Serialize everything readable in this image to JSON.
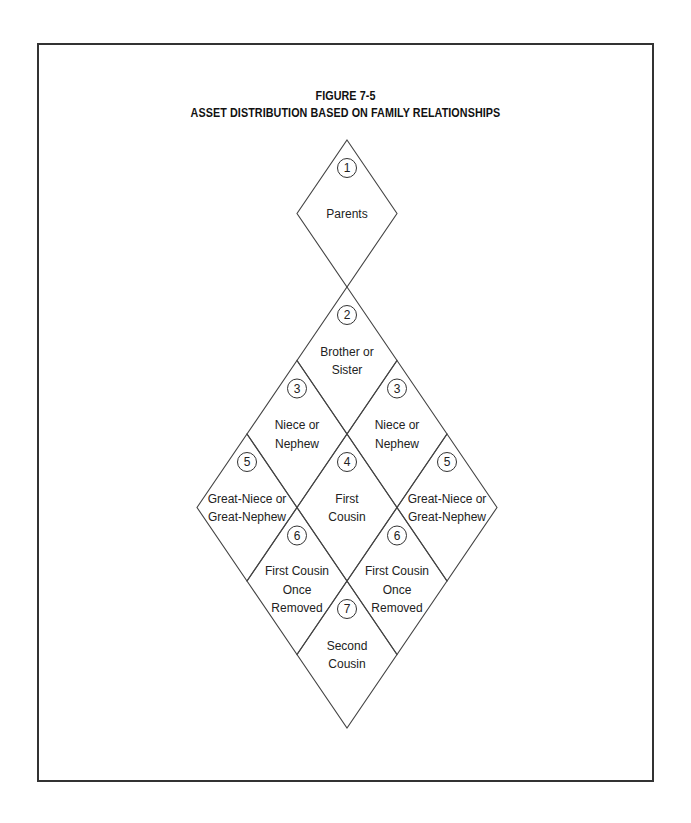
{
  "figure": {
    "number": "FIGURE 7-5",
    "title": "ASSET DISTRIBUTION BASED ON FAMILY RELATIONSHIPS"
  },
  "cells": [
    {
      "id": "parents",
      "order": "1",
      "lines": [
        "Parents"
      ]
    },
    {
      "id": "sibling",
      "order": "2",
      "lines": [
        "Brother or",
        "Sister"
      ]
    },
    {
      "id": "niece-left",
      "order": "3",
      "lines": [
        "Niece or",
        "Nephew"
      ]
    },
    {
      "id": "niece-right",
      "order": "3",
      "lines": [
        "Niece or",
        "Nephew"
      ]
    },
    {
      "id": "first-cousin",
      "order": "4",
      "lines": [
        "First",
        "Cousin"
      ]
    },
    {
      "id": "great-niece-left",
      "order": "5",
      "lines": [
        "Great-Niece or",
        "Great-Nephew"
      ]
    },
    {
      "id": "great-niece-right",
      "order": "5",
      "lines": [
        "Great-Niece or",
        "Great-Nephew"
      ]
    },
    {
      "id": "first-cousin-removed-left",
      "order": "6",
      "lines": [
        "First Cousin",
        "Once",
        "Removed"
      ]
    },
    {
      "id": "first-cousin-removed-right",
      "order": "6",
      "lines": [
        "First Cousin",
        "Once",
        "Removed"
      ]
    },
    {
      "id": "second-cousin",
      "order": "7",
      "lines": [
        "Second",
        "Cousin"
      ]
    }
  ]
}
